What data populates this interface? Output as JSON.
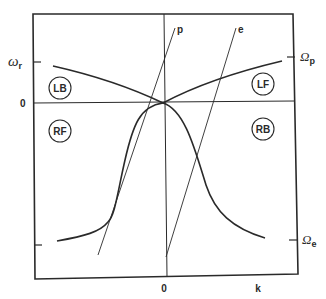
{
  "diagram": {
    "type": "dispersion-diagram",
    "axes": {
      "x_label": "k",
      "x_zero_label": "0",
      "y_zero_label": "0",
      "y_left_tick": {
        "symbol": "ω",
        "subscript": "r"
      },
      "y_right_ticks": [
        {
          "symbol": "Ω",
          "subscript": "p"
        },
        {
          "symbol": "Ω",
          "subscript": "e"
        }
      ]
    },
    "lines": [
      {
        "id": "p",
        "label": "p"
      },
      {
        "id": "e",
        "label": "e"
      }
    ],
    "regions": [
      {
        "id": "LB",
        "label": "LB"
      },
      {
        "id": "LF",
        "label": "LF"
      },
      {
        "id": "RF",
        "label": "RF"
      },
      {
        "id": "RB",
        "label": "RB"
      }
    ],
    "colors": {
      "ink": "#2a2a2a",
      "background": "#ffffff"
    }
  }
}
